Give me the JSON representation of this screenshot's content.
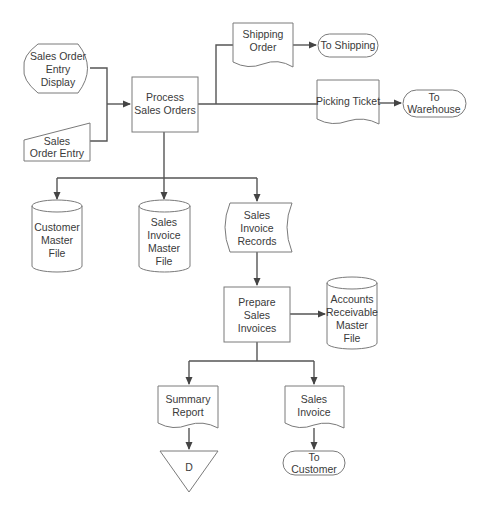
{
  "diagram": {
    "type": "system flowchart",
    "colors": {
      "line": "#555555",
      "shape_stroke": "#7a7a7a",
      "text": "#3a3a3a",
      "background": "#ffffff"
    },
    "nodes": {
      "display": {
        "shape": "display",
        "lines": [
          "Sales Order",
          "Entry",
          "Display"
        ]
      },
      "manual_input": {
        "shape": "manual-input",
        "lines": [
          "Sales",
          "Order Entry"
        ]
      },
      "process_sales_orders": {
        "shape": "process",
        "lines": [
          "Process",
          "Sales Orders"
        ]
      },
      "shipping_order": {
        "shape": "document",
        "lines": [
          "Shipping",
          "Order"
        ]
      },
      "to_shipping": {
        "shape": "terminal",
        "lines": [
          "To Shipping"
        ]
      },
      "picking_ticket": {
        "shape": "document",
        "lines": [
          "Picking Ticket"
        ]
      },
      "to_warehouse": {
        "shape": "terminal",
        "lines": [
          "To",
          "Warehouse"
        ]
      },
      "customer_master_file": {
        "shape": "disk-storage",
        "lines": [
          "Customer",
          "Master",
          "File"
        ]
      },
      "sales_invoice_master_file": {
        "shape": "disk-storage",
        "lines": [
          "Sales",
          "Invoice",
          "Master",
          "File"
        ]
      },
      "sales_invoice_records": {
        "shape": "stored-data",
        "lines": [
          "Sales",
          "Invoice",
          "Records"
        ]
      },
      "prepare_sales_invoices": {
        "shape": "process",
        "lines": [
          "Prepare",
          "Sales",
          "Invoices"
        ]
      },
      "ar_master_file": {
        "shape": "disk-storage",
        "lines": [
          "Accounts",
          "Receivable",
          "Master",
          "File"
        ]
      },
      "summary_report": {
        "shape": "document",
        "lines": [
          "Summary",
          "Report"
        ]
      },
      "offline_file": {
        "shape": "offline-storage",
        "lines": [
          "D"
        ]
      },
      "sales_invoice": {
        "shape": "document",
        "lines": [
          "Sales",
          "Invoice"
        ]
      },
      "to_customer": {
        "shape": "terminal",
        "lines": [
          "To",
          "Customer"
        ]
      }
    },
    "edges": [
      {
        "from": "display",
        "to": "process_sales_orders"
      },
      {
        "from": "manual_input",
        "to": "process_sales_orders"
      },
      {
        "from": "process_sales_orders",
        "to": "shipping_order"
      },
      {
        "from": "process_sales_orders",
        "to": "picking_ticket"
      },
      {
        "from": "shipping_order",
        "to": "to_shipping"
      },
      {
        "from": "picking_ticket",
        "to": "to_warehouse"
      },
      {
        "from": "process_sales_orders",
        "to": "customer_master_file"
      },
      {
        "from": "process_sales_orders",
        "to": "sales_invoice_master_file"
      },
      {
        "from": "process_sales_orders",
        "to": "sales_invoice_records"
      },
      {
        "from": "sales_invoice_records",
        "to": "prepare_sales_invoices"
      },
      {
        "from": "prepare_sales_invoices",
        "to": "ar_master_file"
      },
      {
        "from": "prepare_sales_invoices",
        "to": "summary_report"
      },
      {
        "from": "prepare_sales_invoices",
        "to": "sales_invoice"
      },
      {
        "from": "summary_report",
        "to": "offline_file"
      },
      {
        "from": "sales_invoice",
        "to": "to_customer"
      }
    ]
  }
}
